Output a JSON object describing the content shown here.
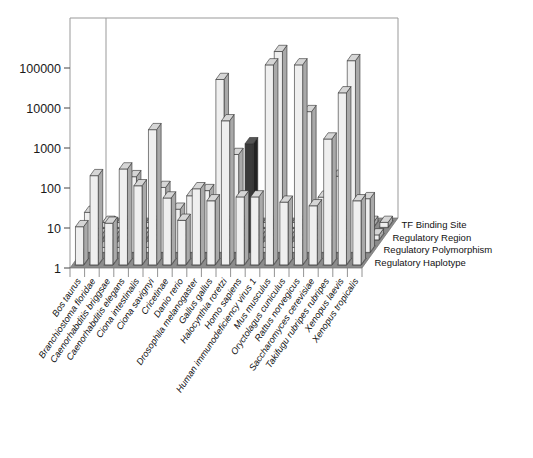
{
  "chart_data": {
    "type": "bar",
    "render": "3d-bar",
    "title": "",
    "xlabel": "",
    "ylabel": "",
    "scale": "log",
    "ylim": [
      1,
      100000
    ],
    "yticks": [
      1,
      10,
      100,
      1000,
      10000,
      100000
    ],
    "ytick_labels": [
      "1",
      "10",
      "100",
      "1000",
      "10000",
      "100000"
    ],
    "grid": false,
    "legend_position": "right",
    "categories": [
      "Bos taurus",
      "Branchiostoma floridae",
      "Caenorhabditis briggsae",
      "Caenorhabditis elegans",
      "Ciona intestinalis",
      "Ciona savignyi",
      "Cricetinae",
      "Danio rerio",
      "Drosophila melanogaster",
      "Gallus gallus",
      "Halocynthia roretzi",
      "Homo sapiens",
      "Human immunodeficiency virus 1",
      "Mus musculus",
      "Oryctolagus cuniculus",
      "Rattus norvegicus",
      "Saccharomyces cerevisiae",
      "Takifugu rubripes rubripes",
      "Xenopus laevis",
      "Xenopus tropicalis"
    ],
    "series": [
      {
        "name": "TF Binding Site",
        "color": "#e8e8e8",
        "values": [
          9,
          170,
          11,
          250,
          95,
          2400,
          47,
          13,
          80,
          40,
          4000,
          50,
          50,
          100000,
          37,
          100000,
          30,
          1400,
          20000,
          40
        ]
      },
      {
        "name": "Regulatory Region",
        "color": "#ededed",
        "values": [
          10,
          1,
          1,
          78,
          1,
          42,
          12,
          26,
          35,
          21000,
          280,
          520,
          1,
          105000,
          1,
          3300,
          24,
          80,
          62000,
          22
        ]
      },
      {
        "name": "Regulatory Polymorphism",
        "color": "#dcdcdc",
        "values": [
          1,
          1,
          1,
          1,
          1,
          1,
          1,
          1,
          1,
          1,
          1,
          1,
          1,
          1,
          1,
          1,
          1,
          1,
          1,
          1
        ]
      },
      {
        "name": "Regulatory Haplotype",
        "color": "#dcdcdc",
        "values": [
          1,
          1,
          1,
          1,
          1,
          1,
          1,
          1,
          1,
          1,
          1,
          1,
          4,
          1,
          1,
          1,
          1,
          1,
          1,
          1
        ]
      }
    ],
    "legend": [
      "TF Binding Site",
      "Regulatory Region",
      "Regulatory Polymorphism",
      "Regulatory Haplotype"
    ],
    "colors": {
      "floor": "#8c8c8c",
      "cell": "#bdbdbd",
      "bar_front": "#efefef",
      "bar_side": "#a9a9a9",
      "bar_top": "#d6d6d6",
      "dark_bar_front": "#3a3a3a",
      "dark_bar_side": "#222222",
      "frame": "#999999",
      "text": "#111111"
    }
  }
}
